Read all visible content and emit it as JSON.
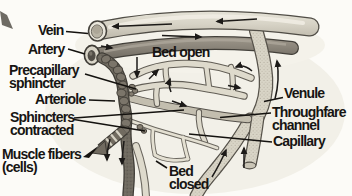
{
  "labels": {
    "vein": "Vein",
    "artery": "Artery",
    "precapillary_sphincter": {
      "line1": "Precapillary",
      "line2": "sphincter"
    },
    "arteriole": "Arteriole",
    "sphincters_contracted": {
      "line1": "Sphincters",
      "line2": "contracted"
    },
    "muscle_fibers": {
      "line1": "Muscle fibers",
      "line2": "(cells)"
    },
    "bed_open": "Bed open",
    "venule": "Venule",
    "throughfare_channel": {
      "line1": "Throughfare",
      "line2": "channel"
    },
    "capillary": "Capillary",
    "bed_closed": {
      "line1": "Bed",
      "line2": "closed"
    }
  },
  "colors": {
    "background": "#fcfbf7",
    "vein_fill": "#d7d3c6",
    "artery_fill": "#8d877c",
    "arteriole_fill": "#6f6a60",
    "capillary_fill": "#dedacc",
    "venule_fill": "#d5d1c3",
    "outline": "#504d46",
    "label_text": "#171513",
    "flow_arrow": "#1c1a18"
  }
}
